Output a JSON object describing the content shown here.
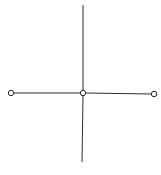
{
  "diagram": {
    "type": "cross-graph",
    "stroke_color": "#2b2b2b",
    "node_fill": "#ffffff",
    "nodes": [
      {
        "id": "left",
        "x": 11,
        "y": 93
      },
      {
        "id": "center",
        "x": 83,
        "y": 93
      },
      {
        "id": "right",
        "x": 154,
        "y": 94
      }
    ],
    "edges": [
      {
        "from": "left",
        "to": "center"
      },
      {
        "from": "center",
        "to": "right"
      },
      {
        "id": "vertical-up",
        "x1": 83,
        "y1": 5,
        "x2": 83,
        "y2": 93
      },
      {
        "id": "vertical-down",
        "x1": 83,
        "y1": 93,
        "x2": 82,
        "y2": 162
      }
    ]
  }
}
